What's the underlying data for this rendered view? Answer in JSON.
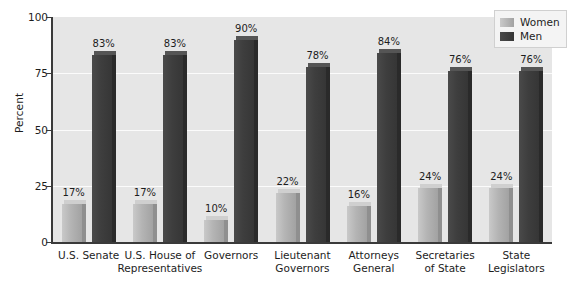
{
  "chart_data": {
    "type": "bar",
    "title": "",
    "xlabel": "",
    "ylabel": "Percent",
    "ylim": [
      0,
      100
    ],
    "yticks": [
      0,
      25,
      50,
      75,
      100
    ],
    "ytick_labels": [
      "0",
      "25",
      "50",
      "75",
      "100"
    ],
    "grid": true,
    "legend_position": "top-right",
    "categories": [
      "U.S. Senate",
      "U.S. House of\nRepresentatives",
      "Governors",
      "Lieutenant\nGovernors",
      "Attorneys\nGeneral",
      "Secretaries\nof State",
      "State\nLegislators"
    ],
    "series": [
      {
        "name": "Women",
        "color": "#b4b4b4",
        "values": [
          17,
          17,
          10,
          22,
          16,
          24,
          24
        ],
        "labels": [
          "17%",
          "17%",
          "10%",
          "22%",
          "16%",
          "24%",
          "24%"
        ]
      },
      {
        "name": "Men",
        "color": "#3e3e3e",
        "values": [
          83,
          83,
          90,
          78,
          84,
          76,
          76
        ],
        "labels": [
          "83%",
          "83%",
          "90%",
          "78%",
          "84%",
          "76%",
          "76%"
        ]
      }
    ]
  },
  "legend": {
    "items": [
      {
        "label": "Women",
        "key": "women"
      },
      {
        "label": "Men",
        "key": "men"
      }
    ]
  },
  "colors": {
    "plot_background": "#e6e6e6",
    "gridline": "#fbfbfb",
    "axis": "#3a3a3a",
    "text": "#1d1d1d",
    "women_bar": "#b4b4b4",
    "men_bar": "#3e3e3e"
  }
}
